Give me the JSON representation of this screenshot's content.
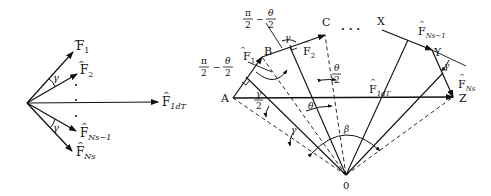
{
  "left_diagram": {
    "vectors": [
      {
        "base": "F",
        "sub": "1"
      },
      {
        "base": "F",
        "sub": "2"
      },
      {
        "base": "F",
        "sub": "1dT"
      },
      {
        "base": "F",
        "sub": "Ns−1"
      },
      {
        "base": "F",
        "sub": "Ns"
      }
    ],
    "angle_label": "γ"
  },
  "right_diagram": {
    "points": {
      "A": "A",
      "B": "B",
      "C": "C",
      "X": "X",
      "Y": "Y",
      "Z": "Z",
      "O": "0"
    },
    "vectors": {
      "F1": {
        "base": "F",
        "sub": "1"
      },
      "F2": {
        "base": "F",
        "sub": "2"
      },
      "F1dT": {
        "base": "F",
        "sub": "1dT"
      },
      "FNs1": {
        "base": "F",
        "sub": "Ns−1"
      },
      "FNs": {
        "base": "F",
        "sub": "Ns"
      }
    },
    "angles": {
      "gamma": "γ",
      "theta": "θ",
      "beta": "β",
      "half_gamma_num": "γ",
      "half_gamma_den": "2",
      "theta_half_num": "θ",
      "theta_half_den": "2",
      "pi_num": "π",
      "pi_den": "2",
      "minus": "−"
    },
    "ellipsis": "· · ·"
  }
}
